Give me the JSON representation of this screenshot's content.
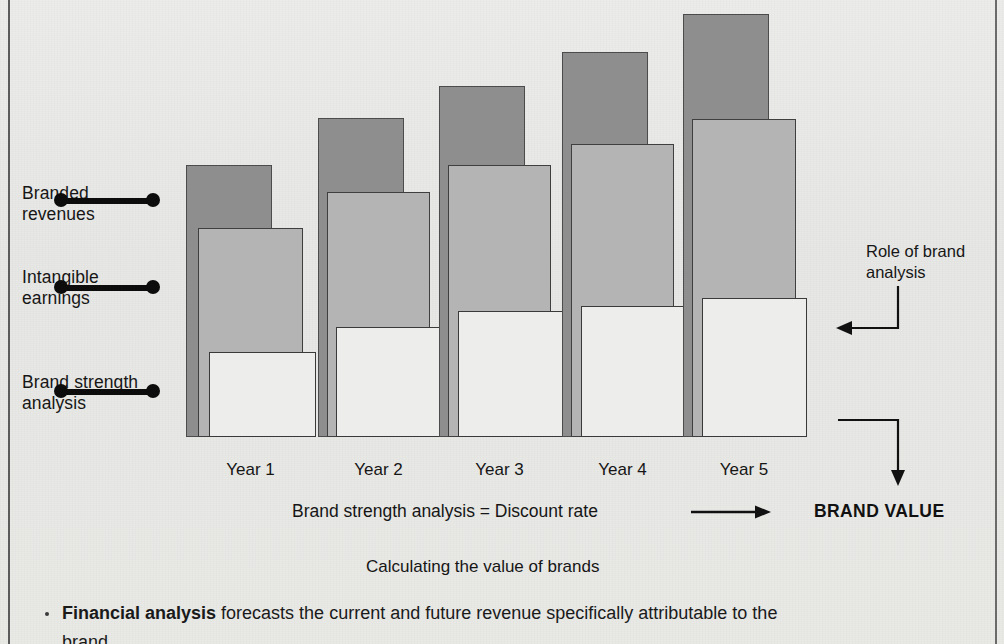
{
  "figure": {
    "caption": "Calculating the value of brands",
    "equation_line": "Brand strength analysis = Discount rate",
    "brand_value_label": "BRAND VALUE",
    "role_label": "Role of brand\nanalysis"
  },
  "series_labels": [
    {
      "key": "branded-revenues",
      "text": "Branded\nrevenues"
    },
    {
      "key": "intangible-earnings",
      "text": "Intangible\nearnings"
    },
    {
      "key": "brand-strength-analysis",
      "text": "Brand strength\nanalysis"
    }
  ],
  "bullets": [
    {
      "bold": "Financial analysis",
      "rest": " forecasts the current and future revenue specifically attributable to the",
      "next": "brand"
    }
  ],
  "colors": {
    "background": "#e9e9e7",
    "branded_revenues": "#8e8e8e",
    "intangible_earnings": "#b4b4b4",
    "brand_strength": "#ededeb",
    "ink": "#161616",
    "border": "#5b5b5b"
  },
  "chart_data": {
    "type": "bar",
    "title": "Calculating the value of brands",
    "xlabel": "",
    "ylabel": "",
    "grid": false,
    "legend_position": "left",
    "note": "Three nested/overlapping rectangles per year, drawn back-to-front and offset down-right: Branded revenues (dark), Intangible earnings (mid grey), Brand strength analysis (white). Heights are relative pixel magnitudes read off the figure; all bars share a common baseline.",
    "categories": [
      "Year 1",
      "Year 2",
      "Year 3",
      "Year 4",
      "Year 5"
    ],
    "series": [
      {
        "name": "Branded revenues",
        "values": [
          272,
          319,
          351,
          385,
          423
        ]
      },
      {
        "name": "Intangible earnings",
        "values": [
          209,
          245,
          272,
          293,
          318
        ]
      },
      {
        "name": "Brand strength analysis",
        "values": [
          85,
          110,
          126,
          131,
          139
        ]
      }
    ],
    "ylim": [
      0,
      440
    ],
    "annotations": [
      "Brand strength analysis = Discount rate",
      "Role of brand analysis",
      "BRAND VALUE"
    ]
  },
  "geometry": {
    "baseline_y": 437,
    "groups": [
      {
        "year": "Year 1",
        "dark": {
          "x": 186,
          "y": 165,
          "w": 86,
          "h": 272
        },
        "mid": {
          "x": 198,
          "y": 228,
          "w": 105,
          "h": 209
        },
        "light": {
          "x": 209,
          "y": 352,
          "w": 107,
          "h": 85
        }
      },
      {
        "year": "Year 2",
        "dark": {
          "x": 318,
          "y": 118,
          "w": 86,
          "h": 319
        },
        "mid": {
          "x": 327,
          "y": 192,
          "w": 103,
          "h": 245
        },
        "light": {
          "x": 336,
          "y": 327,
          "w": 104,
          "h": 110
        }
      },
      {
        "year": "Year 3",
        "dark": {
          "x": 439,
          "y": 86,
          "w": 86,
          "h": 351
        },
        "mid": {
          "x": 448,
          "y": 165,
          "w": 103,
          "h": 272
        },
        "light": {
          "x": 458,
          "y": 311,
          "w": 105,
          "h": 126
        }
      },
      {
        "year": "Year 4",
        "dark": {
          "x": 562,
          "y": 52,
          "w": 86,
          "h": 385
        },
        "mid": {
          "x": 571,
          "y": 144,
          "w": 103,
          "h": 293
        },
        "light": {
          "x": 581,
          "y": 306,
          "w": 105,
          "h": 131
        }
      },
      {
        "year": "Year 5",
        "dark": {
          "x": 683,
          "y": 14,
          "w": 86,
          "h": 423
        },
        "mid": {
          "x": 692,
          "y": 119,
          "w": 104,
          "h": 318
        },
        "light": {
          "x": 702,
          "y": 298,
          "w": 105,
          "h": 139
        }
      }
    ]
  }
}
